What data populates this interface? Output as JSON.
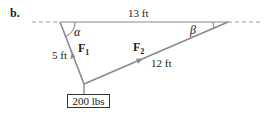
{
  "part_label": "b.",
  "lengths": {
    "top": "13 ft",
    "left": "5 ft",
    "right": "12 ft"
  },
  "angles": {
    "left": "α",
    "right": "β"
  },
  "forces": {
    "f1": {
      "symbol": "F",
      "sub": "1"
    },
    "f2": {
      "symbol": "F",
      "sub": "2"
    }
  },
  "weight": "200 lbs",
  "colors": {
    "line": "#8a8a8a",
    "text": "#222222",
    "box_border": "#333333"
  }
}
